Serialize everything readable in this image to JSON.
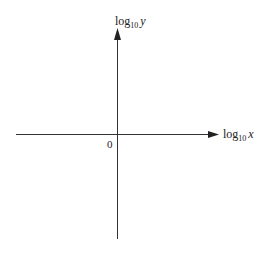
{
  "diagram": {
    "type": "coordinate-axes",
    "x_axis": {
      "label_base": "log",
      "label_sub": "10",
      "label_var": "x",
      "color": "#333333"
    },
    "y_axis": {
      "label_base": "log",
      "label_sub": "10",
      "label_var": "y",
      "color": "#333333"
    },
    "origin_label": "0"
  }
}
